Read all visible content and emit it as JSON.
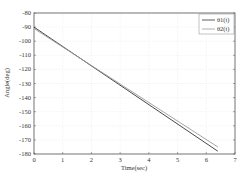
{
  "chart_data": {
    "type": "line",
    "title": "",
    "xlabel": "Time(sec)",
    "ylabel": "Angle(deg)",
    "xlim": [
      0,
      7
    ],
    "ylim": [
      -180,
      -80
    ],
    "xticks": [
      0,
      1,
      2,
      3,
      4,
      5,
      6,
      7
    ],
    "yticks": [
      -80,
      -90,
      -100,
      -110,
      -120,
      -130,
      -140,
      -150,
      -160,
      -170,
      -180
    ],
    "grid": true,
    "legend_position": "upper right",
    "series": [
      {
        "name": "θ1(t)",
        "color": "#333333",
        "x": [
          0,
          6.4
        ],
        "y": [
          -90,
          -178
        ]
      },
      {
        "name": "θ2(t)",
        "color": "#999999",
        "x": [
          0,
          6.4
        ],
        "y": [
          -91,
          -175
        ]
      }
    ]
  },
  "legend": {
    "items": [
      "θ1(t)",
      "θ2(t)"
    ]
  }
}
